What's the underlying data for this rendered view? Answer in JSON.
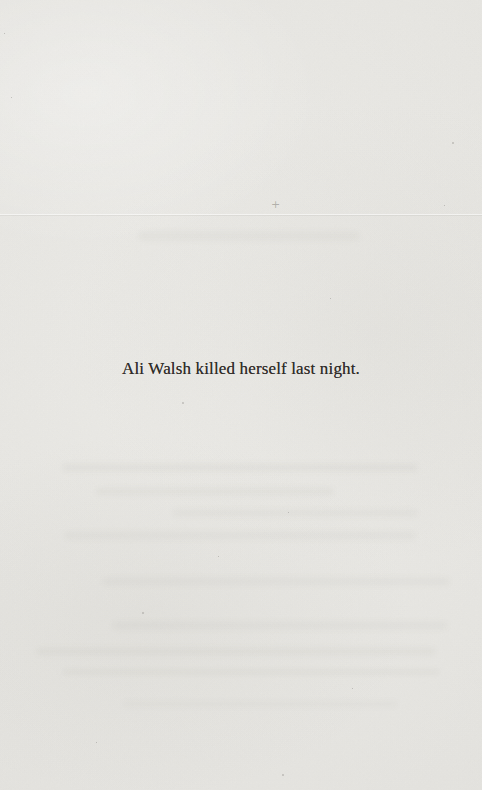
{
  "page": {
    "text": "Ali Walsh killed herself last night.",
    "paper_color": "#e9e8e4",
    "ink_color": "#2f2b28"
  }
}
